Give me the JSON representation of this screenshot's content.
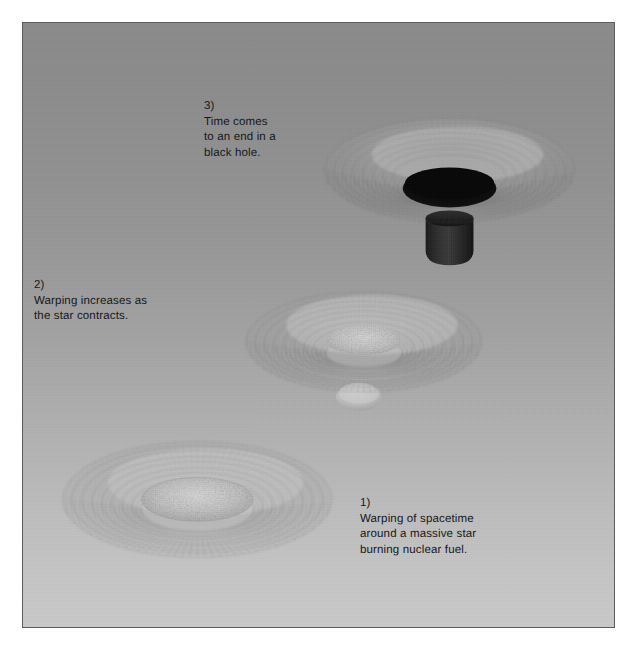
{
  "figure": {
    "background_top_color": "#8b8b8b",
    "background_bottom_color": "#cacaca",
    "border_color": "#5d5d5d",
    "text_color": "#16181a",
    "page_color": "#ffffff"
  },
  "captions": [
    {
      "id": "caption-1",
      "number": "1)",
      "text": "1)\nWarping of spacetime\naround a massive star\nburning nuclear fuel.",
      "lines": [
        "1)",
        "Warping of spacetime",
        "around a massive star",
        "burning nuclear fuel."
      ]
    },
    {
      "id": "caption-2",
      "number": "2)",
      "text": "2)\nWarping increases as\nthe star contracts.",
      "lines": [
        "2)",
        "Warping increases as",
        "the star contracts."
      ]
    },
    {
      "id": "caption-3",
      "number": "3)",
      "text": "3)\nTime comes\nto an end in a\nblack hole.",
      "lines": [
        "3)",
        "Time comes",
        "to an end in a",
        "black hole."
      ]
    }
  ],
  "stages": [
    {
      "id": "stage-1",
      "label": "massive-star-dish",
      "center_x": 175,
      "center_y": 478,
      "outer_rx": 135,
      "outer_ry": 58,
      "well_depth": 34,
      "star_rx": 56,
      "star_ry": 22,
      "has_black_hole": false,
      "has_tube": false
    },
    {
      "id": "stage-2",
      "label": "contracting-star-funnel",
      "center_x": 342,
      "center_y": 320,
      "outer_rx": 118,
      "outer_ry": 50,
      "well_depth": 50,
      "star_rx": 38,
      "star_ry": 15,
      "has_black_hole": false,
      "has_tube": false,
      "has_bulge": true
    },
    {
      "id": "stage-3",
      "label": "black-hole-funnel",
      "center_x": 428,
      "center_y": 148,
      "outer_rx": 125,
      "outer_ry": 52,
      "well_depth": 60,
      "hole_rx": 47,
      "hole_ry": 19,
      "has_black_hole": true,
      "has_tube": true,
      "tube_color": "#222222",
      "hole_color": "#111111"
    }
  ]
}
